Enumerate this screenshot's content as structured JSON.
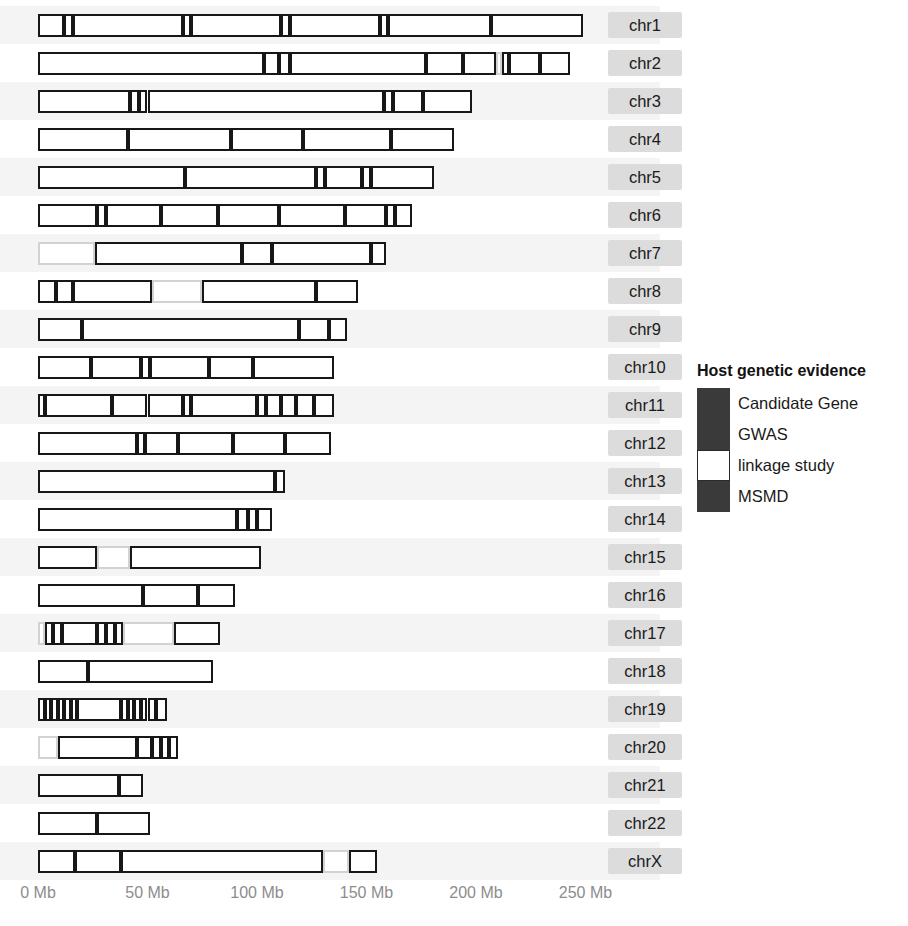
{
  "chart_data": {
    "type": "table",
    "title": "",
    "xlabel": "",
    "ylabel": "",
    "axis": {
      "unit": "Mb",
      "min_mb": 0,
      "max_mb": 250,
      "tick_step_mb": 50,
      "tick_labels": [
        "0 Mb",
        "50 Mb",
        "100 Mb",
        "150 Mb",
        "200 Mb",
        "250 Mb"
      ],
      "tick_values_mb": [
        0,
        50,
        100,
        150,
        200,
        250
      ],
      "px_origin": 38,
      "px_per_mb": 2.19,
      "grid": false
    },
    "legend": {
      "position": "right",
      "title": "Host genetic evidence",
      "entries": [
        {
          "label": "Candidate Gene",
          "color": "#3a3a3a",
          "key": "candidate_gene"
        },
        {
          "label": "GWAS",
          "color": "#3a3a3a",
          "key": "gwas"
        },
        {
          "label": "linkage study",
          "color": "#ffffff",
          "key": "linkage_study"
        },
        {
          "label": "MSMD",
          "color": "#3a3a3a",
          "key": "msmd"
        }
      ]
    },
    "rows": [
      {
        "label": "chr1",
        "length_mb": 249,
        "segments": [
          {
            "start_mb": 0,
            "end_mb": 12,
            "evidence": "dark"
          },
          {
            "start_mb": 12,
            "end_mb": 16,
            "evidence": "dark"
          },
          {
            "start_mb": 16,
            "end_mb": 66,
            "evidence": "dark"
          },
          {
            "start_mb": 66,
            "end_mb": 70,
            "evidence": "dark"
          },
          {
            "start_mb": 70,
            "end_mb": 111,
            "evidence": "dark"
          },
          {
            "start_mb": 111,
            "end_mb": 115,
            "evidence": "dark"
          },
          {
            "start_mb": 115,
            "end_mb": 156,
            "evidence": "dark"
          },
          {
            "start_mb": 156,
            "end_mb": 160,
            "evidence": "dark"
          },
          {
            "start_mb": 160,
            "end_mb": 207,
            "evidence": "dark"
          },
          {
            "start_mb": 207,
            "end_mb": 249,
            "evidence": "dark"
          }
        ]
      },
      {
        "label": "chr2",
        "length_mb": 243,
        "segments": [
          {
            "start_mb": 0,
            "end_mb": 103,
            "evidence": "dark"
          },
          {
            "start_mb": 103,
            "end_mb": 110,
            "evidence": "dark"
          },
          {
            "start_mb": 110,
            "end_mb": 115,
            "evidence": "dark"
          },
          {
            "start_mb": 115,
            "end_mb": 177,
            "evidence": "dark"
          },
          {
            "start_mb": 177,
            "end_mb": 194,
            "evidence": "dark"
          },
          {
            "start_mb": 194,
            "end_mb": 209,
            "evidence": "dark"
          },
          {
            "start_mb": 209,
            "end_mb": 212,
            "evidence": "light"
          },
          {
            "start_mb": 212,
            "end_mb": 215,
            "evidence": "dark"
          },
          {
            "start_mb": 215,
            "end_mb": 229,
            "evidence": "dark"
          },
          {
            "start_mb": 229,
            "end_mb": 243,
            "evidence": "dark"
          }
        ]
      },
      {
        "label": "chr3",
        "length_mb": 198,
        "segments": [
          {
            "start_mb": 0,
            "end_mb": 42,
            "evidence": "dark"
          },
          {
            "start_mb": 42,
            "end_mb": 46,
            "evidence": "dark"
          },
          {
            "start_mb": 46,
            "end_mb": 50,
            "evidence": "dark"
          },
          {
            "start_mb": 50,
            "end_mb": 158,
            "evidence": "dark"
          },
          {
            "start_mb": 158,
            "end_mb": 162,
            "evidence": "dark"
          },
          {
            "start_mb": 162,
            "end_mb": 176,
            "evidence": "dark"
          },
          {
            "start_mb": 176,
            "end_mb": 198,
            "evidence": "dark"
          }
        ]
      },
      {
        "label": "chr4",
        "length_mb": 190,
        "segments": [
          {
            "start_mb": 0,
            "end_mb": 41,
            "evidence": "dark"
          },
          {
            "start_mb": 41,
            "end_mb": 88,
            "evidence": "dark"
          },
          {
            "start_mb": 88,
            "end_mb": 121,
            "evidence": "dark"
          },
          {
            "start_mb": 121,
            "end_mb": 161,
            "evidence": "dark"
          },
          {
            "start_mb": 161,
            "end_mb": 190,
            "evidence": "dark"
          }
        ]
      },
      {
        "label": "chr5",
        "length_mb": 181,
        "segments": [
          {
            "start_mb": 0,
            "end_mb": 67,
            "evidence": "dark"
          },
          {
            "start_mb": 67,
            "end_mb": 127,
            "evidence": "dark"
          },
          {
            "start_mb": 127,
            "end_mb": 131,
            "evidence": "dark"
          },
          {
            "start_mb": 131,
            "end_mb": 148,
            "evidence": "dark"
          },
          {
            "start_mb": 148,
            "end_mb": 152,
            "evidence": "dark"
          },
          {
            "start_mb": 152,
            "end_mb": 181,
            "evidence": "dark"
          }
        ]
      },
      {
        "label": "chr6",
        "length_mb": 171,
        "segments": [
          {
            "start_mb": 0,
            "end_mb": 27,
            "evidence": "dark"
          },
          {
            "start_mb": 27,
            "end_mb": 31,
            "evidence": "dark"
          },
          {
            "start_mb": 31,
            "end_mb": 56,
            "evidence": "dark"
          },
          {
            "start_mb": 56,
            "end_mb": 82,
            "evidence": "dark"
          },
          {
            "start_mb": 82,
            "end_mb": 110,
            "evidence": "dark"
          },
          {
            "start_mb": 110,
            "end_mb": 140,
            "evidence": "dark"
          },
          {
            "start_mb": 140,
            "end_mb": 159,
            "evidence": "dark"
          },
          {
            "start_mb": 159,
            "end_mb": 163,
            "evidence": "dark"
          },
          {
            "start_mb": 163,
            "end_mb": 171,
            "evidence": "dark"
          }
        ]
      },
      {
        "label": "chr7",
        "length_mb": 159,
        "segments": [
          {
            "start_mb": 0,
            "end_mb": 26,
            "evidence": "light"
          },
          {
            "start_mb": 26,
            "end_mb": 93,
            "evidence": "dark"
          },
          {
            "start_mb": 93,
            "end_mb": 107,
            "evidence": "dark"
          },
          {
            "start_mb": 107,
            "end_mb": 152,
            "evidence": "dark"
          },
          {
            "start_mb": 152,
            "end_mb": 159,
            "evidence": "dark"
          }
        ]
      },
      {
        "label": "chr8",
        "length_mb": 146,
        "segments": [
          {
            "start_mb": 0,
            "end_mb": 8,
            "evidence": "dark"
          },
          {
            "start_mb": 8,
            "end_mb": 16,
            "evidence": "dark"
          },
          {
            "start_mb": 16,
            "end_mb": 52,
            "evidence": "dark"
          },
          {
            "start_mb": 52,
            "end_mb": 75,
            "evidence": "light"
          },
          {
            "start_mb": 75,
            "end_mb": 127,
            "evidence": "dark"
          },
          {
            "start_mb": 127,
            "end_mb": 146,
            "evidence": "dark"
          }
        ]
      },
      {
        "label": "chr9",
        "length_mb": 141,
        "segments": [
          {
            "start_mb": 0,
            "end_mb": 20,
            "evidence": "dark"
          },
          {
            "start_mb": 20,
            "end_mb": 119,
            "evidence": "dark"
          },
          {
            "start_mb": 119,
            "end_mb": 133,
            "evidence": "dark"
          },
          {
            "start_mb": 133,
            "end_mb": 141,
            "evidence": "dark"
          }
        ]
      },
      {
        "label": "chr10",
        "length_mb": 135,
        "segments": [
          {
            "start_mb": 0,
            "end_mb": 24,
            "evidence": "dark"
          },
          {
            "start_mb": 24,
            "end_mb": 47,
            "evidence": "dark"
          },
          {
            "start_mb": 47,
            "end_mb": 51,
            "evidence": "dark"
          },
          {
            "start_mb": 51,
            "end_mb": 78,
            "evidence": "dark"
          },
          {
            "start_mb": 78,
            "end_mb": 98,
            "evidence": "dark"
          },
          {
            "start_mb": 98,
            "end_mb": 135,
            "evidence": "dark"
          }
        ]
      },
      {
        "label": "chr11",
        "length_mb": 135,
        "segments": [
          {
            "start_mb": 0,
            "end_mb": 3,
            "evidence": "dark"
          },
          {
            "start_mb": 3,
            "end_mb": 34,
            "evidence": "dark"
          },
          {
            "start_mb": 34,
            "end_mb": 50,
            "evidence": "dark"
          },
          {
            "start_mb": 50,
            "end_mb": 66,
            "evidence": "dark"
          },
          {
            "start_mb": 66,
            "end_mb": 70,
            "evidence": "dark"
          },
          {
            "start_mb": 70,
            "end_mb": 100,
            "evidence": "dark"
          },
          {
            "start_mb": 100,
            "end_mb": 104,
            "evidence": "dark"
          },
          {
            "start_mb": 104,
            "end_mb": 111,
            "evidence": "dark"
          },
          {
            "start_mb": 111,
            "end_mb": 118,
            "evidence": "dark"
          },
          {
            "start_mb": 118,
            "end_mb": 126,
            "evidence": "dark"
          },
          {
            "start_mb": 126,
            "end_mb": 135,
            "evidence": "dark"
          }
        ]
      },
      {
        "label": "chr12",
        "length_mb": 134,
        "segments": [
          {
            "start_mb": 0,
            "end_mb": 45,
            "evidence": "dark"
          },
          {
            "start_mb": 45,
            "end_mb": 49,
            "evidence": "dark"
          },
          {
            "start_mb": 49,
            "end_mb": 64,
            "evidence": "dark"
          },
          {
            "start_mb": 64,
            "end_mb": 89,
            "evidence": "dark"
          },
          {
            "start_mb": 89,
            "end_mb": 113,
            "evidence": "dark"
          },
          {
            "start_mb": 113,
            "end_mb": 134,
            "evidence": "dark"
          }
        ]
      },
      {
        "label": "chr13",
        "length_mb": 113,
        "segments": [
          {
            "start_mb": 0,
            "end_mb": 108,
            "evidence": "dark"
          },
          {
            "start_mb": 108,
            "end_mb": 113,
            "evidence": "dark"
          }
        ]
      },
      {
        "label": "chr14",
        "length_mb": 107,
        "segments": [
          {
            "start_mb": 0,
            "end_mb": 91,
            "evidence": "dark"
          },
          {
            "start_mb": 91,
            "end_mb": 96,
            "evidence": "dark"
          },
          {
            "start_mb": 96,
            "end_mb": 100,
            "evidence": "dark"
          },
          {
            "start_mb": 100,
            "end_mb": 107,
            "evidence": "dark"
          }
        ]
      },
      {
        "label": "chr15",
        "length_mb": 102,
        "segments": [
          {
            "start_mb": 0,
            "end_mb": 27,
            "evidence": "dark"
          },
          {
            "start_mb": 27,
            "end_mb": 42,
            "evidence": "light"
          },
          {
            "start_mb": 42,
            "end_mb": 102,
            "evidence": "dark"
          }
        ]
      },
      {
        "label": "chr16",
        "length_mb": 90,
        "segments": [
          {
            "start_mb": 0,
            "end_mb": 48,
            "evidence": "dark"
          },
          {
            "start_mb": 48,
            "end_mb": 73,
            "evidence": "dark"
          },
          {
            "start_mb": 73,
            "end_mb": 90,
            "evidence": "dark"
          }
        ]
      },
      {
        "label": "chr17",
        "length_mb": 83,
        "segments": [
          {
            "start_mb": 0,
            "end_mb": 3,
            "evidence": "light"
          },
          {
            "start_mb": 3,
            "end_mb": 7,
            "evidence": "dark"
          },
          {
            "start_mb": 7,
            "end_mb": 11,
            "evidence": "dark"
          },
          {
            "start_mb": 11,
            "end_mb": 27,
            "evidence": "dark"
          },
          {
            "start_mb": 27,
            "end_mb": 31,
            "evidence": "dark"
          },
          {
            "start_mb": 31,
            "end_mb": 35,
            "evidence": "dark"
          },
          {
            "start_mb": 35,
            "end_mb": 39,
            "evidence": "dark"
          },
          {
            "start_mb": 39,
            "end_mb": 62,
            "evidence": "light"
          },
          {
            "start_mb": 62,
            "end_mb": 83,
            "evidence": "dark"
          }
        ]
      },
      {
        "label": "chr18",
        "length_mb": 80,
        "segments": [
          {
            "start_mb": 0,
            "end_mb": 23,
            "evidence": "dark"
          },
          {
            "start_mb": 23,
            "end_mb": 80,
            "evidence": "dark"
          }
        ]
      },
      {
        "label": "chr19",
        "length_mb": 59,
        "segments": [
          {
            "start_mb": 0,
            "end_mb": 3,
            "evidence": "dark"
          },
          {
            "start_mb": 3,
            "end_mb": 6,
            "evidence": "dark"
          },
          {
            "start_mb": 6,
            "end_mb": 9,
            "evidence": "dark"
          },
          {
            "start_mb": 9,
            "end_mb": 12,
            "evidence": "dark"
          },
          {
            "start_mb": 12,
            "end_mb": 15,
            "evidence": "dark"
          },
          {
            "start_mb": 15,
            "end_mb": 18,
            "evidence": "dark"
          },
          {
            "start_mb": 18,
            "end_mb": 38,
            "evidence": "dark"
          },
          {
            "start_mb": 38,
            "end_mb": 41,
            "evidence": "dark"
          },
          {
            "start_mb": 41,
            "end_mb": 44,
            "evidence": "dark"
          },
          {
            "start_mb": 44,
            "end_mb": 47,
            "evidence": "dark"
          },
          {
            "start_mb": 47,
            "end_mb": 50,
            "evidence": "dark"
          },
          {
            "start_mb": 50,
            "end_mb": 54,
            "evidence": "dark"
          },
          {
            "start_mb": 54,
            "end_mb": 59,
            "evidence": "dark"
          }
        ]
      },
      {
        "label": "chr20",
        "length_mb": 64,
        "segments": [
          {
            "start_mb": 0,
            "end_mb": 9,
            "evidence": "light"
          },
          {
            "start_mb": 9,
            "end_mb": 45,
            "evidence": "dark"
          },
          {
            "start_mb": 45,
            "end_mb": 52,
            "evidence": "dark"
          },
          {
            "start_mb": 52,
            "end_mb": 56,
            "evidence": "dark"
          },
          {
            "start_mb": 56,
            "end_mb": 60,
            "evidence": "dark"
          },
          {
            "start_mb": 60,
            "end_mb": 64,
            "evidence": "dark"
          }
        ]
      },
      {
        "label": "chr21",
        "length_mb": 48,
        "segments": [
          {
            "start_mb": 0,
            "end_mb": 37,
            "evidence": "dark"
          },
          {
            "start_mb": 37,
            "end_mb": 48,
            "evidence": "dark"
          }
        ]
      },
      {
        "label": "chr22",
        "length_mb": 51,
        "segments": [
          {
            "start_mb": 0,
            "end_mb": 27,
            "evidence": "dark"
          },
          {
            "start_mb": 27,
            "end_mb": 51,
            "evidence": "dark"
          }
        ]
      },
      {
        "label": "chrX",
        "length_mb": 155,
        "segments": [
          {
            "start_mb": 0,
            "end_mb": 17,
            "evidence": "dark"
          },
          {
            "start_mb": 17,
            "end_mb": 38,
            "evidence": "dark"
          },
          {
            "start_mb": 38,
            "end_mb": 130,
            "evidence": "dark"
          },
          {
            "start_mb": 130,
            "end_mb": 142,
            "evidence": "light"
          },
          {
            "start_mb": 142,
            "end_mb": 155,
            "evidence": "dark"
          }
        ]
      }
    ]
  }
}
